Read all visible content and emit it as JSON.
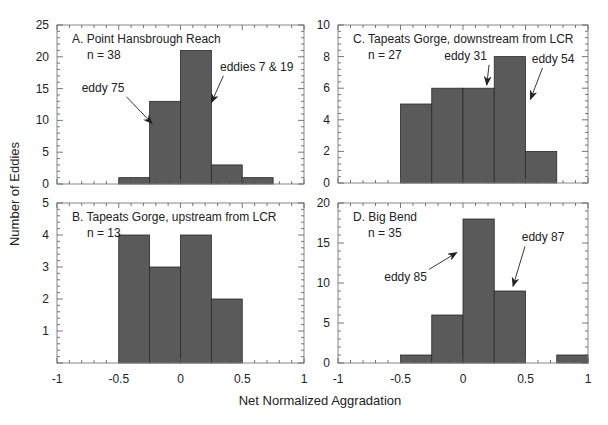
{
  "figure": {
    "ylabel": "Number of Eddies",
    "xlabel": "Net Normalized Aggradation",
    "bar_color": "#5a5a5a",
    "frame_color": "#888888"
  },
  "chart_data": [
    {
      "type": "bar",
      "title": "A. Point Hansbrough Reach",
      "n_label": "n = 38",
      "bin_edges": [
        -0.5,
        -0.25,
        0,
        0.25,
        0.5,
        0.75
      ],
      "values": [
        1,
        13,
        21,
        3,
        1
      ],
      "xlim": [
        -1,
        1
      ],
      "ylim": [
        0,
        25
      ],
      "yticks": [
        0,
        5,
        10,
        15,
        20,
        25
      ],
      "xticks": [],
      "annotations": [
        {
          "text": "eddy 75",
          "tx": -0.8,
          "ty": 14.5,
          "ax": -0.23,
          "ay": 9.5
        },
        {
          "text": "eddies 7 & 19",
          "tx": 0.32,
          "ty": 17.8,
          "ax": 0.25,
          "ay": 12.8
        }
      ],
      "frame": {
        "x": 57,
        "y": 25,
        "w": 247,
        "h": 159
      }
    },
    {
      "type": "bar",
      "title": "B. Tapeats Gorge, upstream from LCR",
      "n_label": "n = 13",
      "bin_edges": [
        -0.5,
        -0.25,
        0,
        0.25,
        0.5
      ],
      "values": [
        4,
        3,
        4,
        2
      ],
      "xlim": [
        -1,
        1
      ],
      "ylim": [
        0,
        5
      ],
      "yticks": [
        1,
        2,
        3,
        4,
        5
      ],
      "xticks": [
        -1,
        -0.5,
        0,
        0.5,
        1
      ],
      "annotations": [],
      "frame": {
        "x": 57,
        "y": 203,
        "w": 247,
        "h": 160
      }
    },
    {
      "type": "bar",
      "title": "C. Tapeats Gorge, downstream from LCR",
      "n_label": "n = 27",
      "bin_edges": [
        -0.5,
        -0.25,
        0,
        0.25,
        0.5,
        0.75
      ],
      "values": [
        5,
        6,
        6,
        8,
        2
      ],
      "xlim": [
        -1,
        1
      ],
      "ylim": [
        0,
        10
      ],
      "yticks": [
        0,
        2,
        4,
        6,
        8,
        10
      ],
      "xticks": [],
      "annotations": [
        {
          "text": "eddy 31",
          "tx": -0.15,
          "ty": 7.8,
          "ax": 0.19,
          "ay": 6.2
        },
        {
          "text": "eddy 54",
          "tx": 0.55,
          "ty": 7.6,
          "ax": 0.54,
          "ay": 5.3
        }
      ],
      "frame": {
        "x": 338,
        "y": 25,
        "w": 250,
        "h": 158
      }
    },
    {
      "type": "bar",
      "title": "D. Big Bend",
      "n_label": "n = 35",
      "bin_edges": [
        -0.5,
        -0.25,
        0,
        0.25,
        0.5,
        0.75,
        1.0
      ],
      "values": [
        1,
        6,
        18,
        9,
        0,
        1
      ],
      "xlim": [
        -1,
        1
      ],
      "ylim": [
        0,
        20
      ],
      "yticks": [
        0,
        5,
        10,
        15,
        20
      ],
      "xticks": [
        -1,
        -0.5,
        0,
        0.5,
        1
      ],
      "annotations": [
        {
          "text": "eddy 85",
          "tx": -0.63,
          "ty": 10.2,
          "ax": -0.05,
          "ay": 13.8
        },
        {
          "text": "eddy 87",
          "tx": 0.47,
          "ty": 15.2,
          "ax": 0.4,
          "ay": 9.6
        }
      ],
      "frame": {
        "x": 338,
        "y": 203,
        "w": 250,
        "h": 160
      }
    }
  ]
}
